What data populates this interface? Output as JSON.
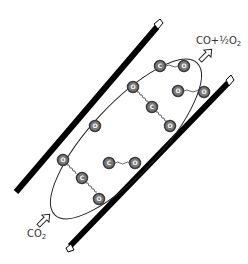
{
  "diagram": {
    "type": "membrane-reactor-schematic",
    "labels": {
      "output": {
        "text": "CO+½O",
        "sub": "2"
      },
      "input": {
        "text": "CO",
        "sub": "2"
      }
    },
    "atom_symbols": {
      "carbon": "C",
      "oxygen": "O"
    },
    "molecules": [
      {
        "name": "co2-top",
        "atoms": [
          {
            "el": "C",
            "x": 160,
            "y": 66
          },
          {
            "el": "O",
            "x": 184,
            "y": 66
          }
        ],
        "note": "C-O top pair"
      },
      {
        "name": "co2-upper-chain",
        "atoms": [
          {
            "el": "O",
            "x": 133,
            "y": 87
          },
          {
            "el": "C",
            "x": 152,
            "y": 107
          },
          {
            "el": "O",
            "x": 170,
            "y": 126
          }
        ]
      },
      {
        "name": "o2-right",
        "atoms": [
          {
            "el": "O",
            "x": 178,
            "y": 91
          },
          {
            "el": "O",
            "x": 204,
            "y": 92
          }
        ]
      },
      {
        "name": "o-single",
        "atoms": [
          {
            "el": "O",
            "x": 95,
            "y": 126
          }
        ]
      },
      {
        "name": "co-middle",
        "atoms": [
          {
            "el": "C",
            "x": 109,
            "y": 163
          },
          {
            "el": "O",
            "x": 135,
            "y": 163
          }
        ]
      },
      {
        "name": "co2-lower-chain",
        "atoms": [
          {
            "el": "O",
            "x": 63,
            "y": 160
          },
          {
            "el": "C",
            "x": 82,
            "y": 178
          },
          {
            "el": "O",
            "x": 99,
            "y": 199
          }
        ]
      }
    ],
    "colors": {
      "wall": "#000000",
      "atom_fill": "#7a7a7a",
      "atom_ring": "#3a3a3a",
      "ellipse": "#222222",
      "text": "#333333"
    }
  }
}
